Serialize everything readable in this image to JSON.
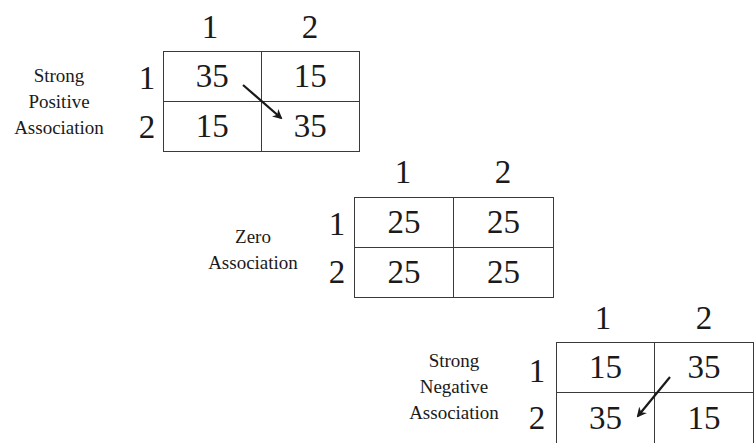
{
  "diagram": {
    "type": "contingency-tables-association",
    "panels": [
      {
        "id": "positive",
        "description_lines": [
          "Strong",
          "Positive",
          "Association"
        ],
        "column_labels": [
          "1",
          "2"
        ],
        "row_labels": [
          "1",
          "2"
        ],
        "cells": [
          [
            "35",
            "15"
          ],
          [
            "15",
            "35"
          ]
        ],
        "arrow": {
          "direction": "top-left to bottom-right",
          "from_cell": "1,1",
          "to_cell": "2,2"
        }
      },
      {
        "id": "zero",
        "description_lines": [
          "Zero",
          "Association"
        ],
        "column_labels": [
          "1",
          "2"
        ],
        "row_labels": [
          "1",
          "2"
        ],
        "cells": [
          [
            "25",
            "25"
          ],
          [
            "25",
            "25"
          ]
        ],
        "arrow": null
      },
      {
        "id": "negative",
        "description_lines": [
          "Strong",
          "Negative",
          "Association"
        ],
        "column_labels": [
          "1",
          "2"
        ],
        "row_labels": [
          "1",
          "2"
        ],
        "cells": [
          [
            "15",
            "35"
          ],
          [
            "35",
            "15"
          ]
        ],
        "arrow": {
          "direction": "top-right to bottom-left",
          "from_cell": "1,2",
          "to_cell": "2,1"
        }
      }
    ],
    "colors": {
      "text": "#1a1a1a",
      "border": "#3a3a3a",
      "background": "#ffffff"
    }
  }
}
